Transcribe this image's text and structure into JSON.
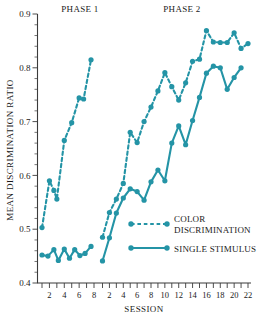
{
  "chart_data": {
    "type": "line",
    "title": "",
    "xlabel": "SESSION",
    "ylabel": "MEAN DISCRIMINATION RATIO",
    "ylim": [
      0.4,
      0.9
    ],
    "ytick_labels": [
      "0.4",
      "0.5",
      "0.6",
      "0.7",
      "0.8",
      "0.9"
    ],
    "ytick_values": [
      0.4,
      0.5,
      0.6,
      0.7,
      0.8,
      0.9
    ],
    "yminor_step": 0.02,
    "grid": false,
    "legend_position": "lower-right",
    "accent_color": "#2494a6",
    "phases": [
      {
        "name": "PHASE 1",
        "sessions": [
          1,
          2,
          3,
          4,
          5,
          6,
          7,
          8
        ],
        "xtick_labels": [
          "2",
          "4",
          "6",
          "8"
        ],
        "xtick_sessions": [
          2,
          4,
          6,
          8
        ]
      },
      {
        "name": "PHASE 2",
        "sessions": [
          1,
          2,
          3,
          4,
          5,
          6,
          7,
          8,
          9,
          10,
          11,
          12,
          13,
          14,
          15,
          16,
          17,
          18,
          19,
          20,
          21,
          22
        ],
        "xtick_labels": [
          "2",
          "4",
          "6",
          "8",
          "10",
          "12",
          "14",
          "16",
          "18",
          "20",
          "22"
        ],
        "xtick_sessions": [
          2,
          4,
          6,
          8,
          10,
          12,
          14,
          16,
          18,
          20,
          22
        ]
      }
    ],
    "series": [
      {
        "name": "COLOR DISCRIMINATION",
        "style": "dashed",
        "marker": "circle",
        "color": "#2494a6",
        "phase1_values": [
          0.503,
          0.59,
          0.572,
          0.556,
          0.665,
          0.698,
          0.744,
          0.742,
          0.815
        ],
        "phase1_x": [
          1,
          2,
          2.6,
          3,
          4,
          5,
          6,
          6.6,
          7.6
        ],
        "phase2_values": [
          0.485,
          0.531,
          0.556,
          0.585,
          0.68,
          0.661,
          0.7,
          0.727,
          0.757,
          0.791,
          0.765,
          0.74,
          0.772,
          0.812,
          0.816,
          0.869,
          0.848,
          0.847,
          0.847,
          0.865,
          0.836,
          0.845
        ],
        "phase2_x": [
          1,
          2,
          3,
          4,
          5,
          6,
          7,
          8,
          9,
          10,
          11,
          12,
          13,
          14,
          15,
          16,
          17,
          18,
          19,
          20,
          21,
          22
        ]
      },
      {
        "name": "SINGLE STIMULUS",
        "style": "solid",
        "marker": "circle",
        "color": "#2494a6",
        "phase1_values": [
          0.452,
          0.45,
          0.462,
          0.442,
          0.463,
          0.446,
          0.462,
          0.451,
          0.455,
          0.468
        ],
        "phase1_x": [
          1,
          1.8,
          2.6,
          3.2,
          4,
          4.7,
          5.4,
          6.1,
          6.8,
          7.6
        ],
        "phase2_values": [
          0.441,
          0.484,
          0.53,
          0.558,
          0.575,
          0.57,
          0.554,
          0.588,
          0.61,
          0.59,
          0.66,
          0.692,
          0.657,
          0.702,
          0.745,
          0.79,
          0.803,
          0.8,
          0.76,
          0.782,
          0.8
        ],
        "phase2_x": [
          1,
          2,
          3,
          4,
          5,
          6,
          7,
          8,
          9,
          10,
          11,
          12,
          13,
          14,
          15,
          16,
          17,
          18,
          19,
          20,
          21
        ]
      }
    ],
    "legend": [
      {
        "label_line1": "COLOR",
        "label_line2": "DISCRIMINATION",
        "style": "dashed"
      },
      {
        "label_line1": "SINGLE STIMULUS",
        "label_line2": "",
        "style": "solid"
      }
    ]
  }
}
